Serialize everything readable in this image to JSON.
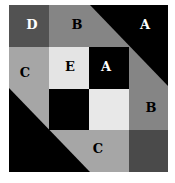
{
  "diagram": {
    "colors": {
      "A": "#000000",
      "B": "#858585",
      "C": "#a6a6a6",
      "D": "#525252",
      "E": "#e4e4e4",
      "F": "#4a4a4a",
      "background": "#ffffff"
    },
    "labels": [
      {
        "id": "D",
        "text": "D",
        "x": 32,
        "y": 24,
        "color": "#ffffff"
      },
      {
        "id": "B-top",
        "text": "B",
        "x": 77,
        "y": 24,
        "color": "#000000"
      },
      {
        "id": "A-top",
        "text": "A",
        "x": 145,
        "y": 24,
        "color": "#ffffff"
      },
      {
        "id": "C-left",
        "text": "C",
        "x": 25,
        "y": 72,
        "color": "#000000"
      },
      {
        "id": "E",
        "text": "E",
        "x": 70,
        "y": 66,
        "color": "#000000"
      },
      {
        "id": "A-center",
        "text": "A",
        "x": 106,
        "y": 66,
        "color": "#ffffff"
      },
      {
        "id": "B-right",
        "text": "B",
        "x": 151,
        "y": 107,
        "color": "#000000"
      },
      {
        "id": "C-bottom",
        "text": "C",
        "x": 98,
        "y": 148,
        "color": "#000000"
      }
    ]
  }
}
